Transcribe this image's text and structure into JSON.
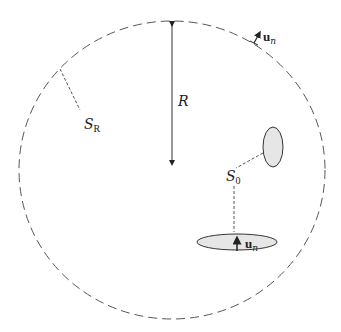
{
  "diagram": {
    "outer_surface": {
      "label_main": "S",
      "label_sub": "R",
      "style": "dashed"
    },
    "radius": {
      "label": "R"
    },
    "inner_surface": {
      "label_main": "S",
      "label_sub": "0"
    },
    "normals": [
      {
        "label_main": "u",
        "label_sub": "n",
        "location": "outer-surface-top-right"
      },
      {
        "label_main": "u",
        "label_sub": "n",
        "location": "bottom-ellipse"
      }
    ],
    "colors": {
      "line": "#333333",
      "dash": "#555555",
      "fill": "#e6e6e6"
    }
  }
}
